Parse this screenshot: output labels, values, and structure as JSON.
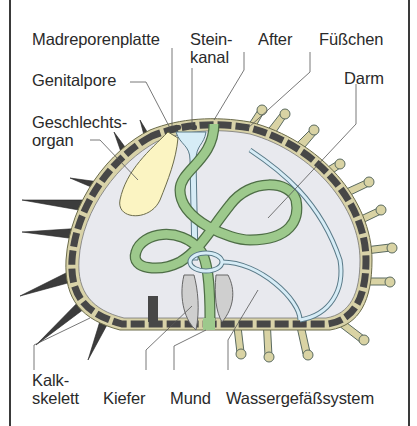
{
  "figure": {
    "colors": {
      "skeleton": "#4a4a4a",
      "skeleton_rim": "#d8d2a8",
      "body_cavity": "#e8e9ee",
      "gonad": "#fbf4c2",
      "gut": "#9dc98c",
      "gut_outline": "#4e6e46",
      "water_vascular": "#d6ecf6",
      "water_vascular_outline": "#5a7a88",
      "jaw": "#cfcfcf",
      "podia_tip": "#d9d3a4",
      "leader_line": "#555555"
    }
  },
  "labels": {
    "madreporenplatte": "Madreporenplatte",
    "steinkanal_1": "Stein-",
    "steinkanal_2": "kanal",
    "after": "After",
    "fuesschen": "Füßchen",
    "darm": "Darm",
    "genitalpore": "Genitalpore",
    "geschlechtsorgan_1": "Geschlechts-",
    "geschlechtsorgan_2": "organ",
    "kalkskelett_1": "Kalk-",
    "kalkskelett_2": "skelett",
    "kiefer": "Kiefer",
    "mund": "Mund",
    "wassergefaesssystem": "Wassergefäßsystem"
  }
}
